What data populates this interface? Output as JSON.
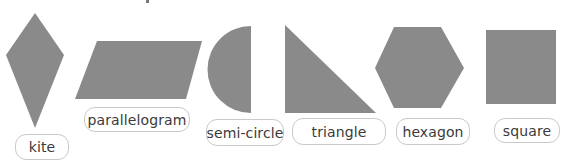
{
  "colors": {
    "shape_fill": "#8a8a8a",
    "label_border": "#c9c9c9",
    "label_text": "#3a3a3a",
    "background": "#ffffff"
  },
  "shapes": [
    {
      "name": "kite",
      "label": "kite",
      "points": "35,13 64,55 35,128 6,55"
    },
    {
      "name": "parallelogram",
      "label": "parallelogram",
      "points": "97,41 202,41 186,99 75,99"
    },
    {
      "name": "semi-circle",
      "label": "semi-circle"
    },
    {
      "name": "triangle",
      "label": "triangle",
      "points": "285,25 376,113 285,113"
    },
    {
      "name": "hexagon",
      "label": "hexagon",
      "points": "394,27 441,27 464,68 441,108 394,108 375,68"
    },
    {
      "name": "square",
      "label": "square"
    }
  ]
}
